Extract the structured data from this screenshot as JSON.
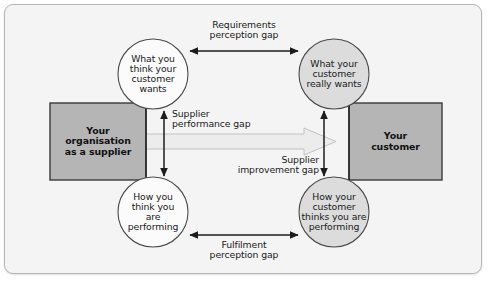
{
  "diagram": {
    "frame": {
      "background_color": "#f4f4f4",
      "border_color": "#b6b6b6"
    },
    "palette": {
      "box_fill": "#b5b5b5",
      "box_stroke": "#3a3a3a",
      "left_circle_fill": "#fbfbfb",
      "right_circle_fill": "#dcdcdc",
      "circle_stroke": "#4a4a4a",
      "arrow_color": "#1c1c1c",
      "wide_arrow_fill": "#ececec",
      "wide_arrow_stroke": "#c0c0c0",
      "text_color": "#1a1a1a"
    },
    "boxes": [
      {
        "id": "supplier-box",
        "lines": [
          "Your",
          "organisation",
          "as a supplier"
        ]
      },
      {
        "id": "customer-box",
        "lines": [
          "Your",
          "customer"
        ]
      }
    ],
    "circles": [
      {
        "id": "what-you-think-customer-wants",
        "lines": [
          "What you",
          "think your",
          "customer",
          "wants"
        ]
      },
      {
        "id": "what-customer-really-wants",
        "lines": [
          "What your",
          "customer",
          "really wants"
        ]
      },
      {
        "id": "how-you-think-you-are-performing",
        "lines": [
          "How you",
          "think you",
          "are",
          "performing"
        ]
      },
      {
        "id": "how-customer-thinks-you-are-performing",
        "lines": [
          "How your",
          "customer",
          "thinks you are",
          "performing"
        ]
      }
    ],
    "gaps": [
      {
        "id": "requirements-perception-gap",
        "lines": [
          "Requirements",
          "perception gap"
        ],
        "arrow": "double-horizontal"
      },
      {
        "id": "supplier-performance-gap",
        "lines": [
          "Supplier",
          "performance gap"
        ],
        "arrow": "double-vertical"
      },
      {
        "id": "supplier-improvement-gap",
        "lines": [
          "Supplier",
          "improvement gap"
        ],
        "arrow": "double-vertical"
      },
      {
        "id": "fulfilment-perception-gap",
        "lines": [
          "Fulfilment",
          "perception gap"
        ],
        "arrow": "double-horizontal"
      }
    ],
    "flow_arrow": {
      "id": "supply-flow-arrow",
      "direction": "left-to-right",
      "label": ""
    }
  }
}
